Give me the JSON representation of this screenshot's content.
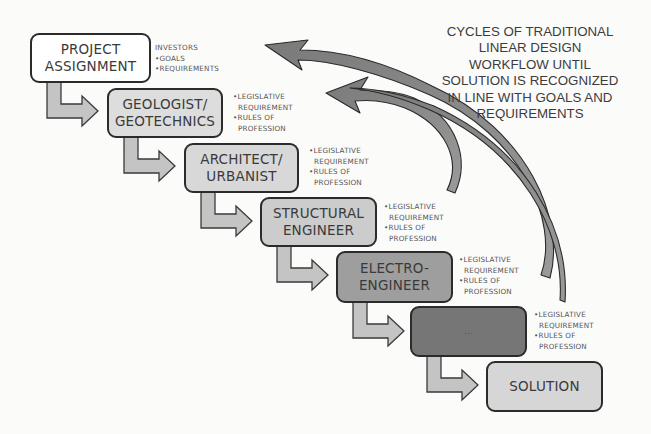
{
  "caption": {
    "lines": [
      "CYCLES OF TRADITIONAL",
      "LINEAR DESIGN",
      "WORKFLOW UNTIL",
      "SOLUTION IS RECOGNIZED",
      "IN LINE WITH GOALS AND",
      "REQUIREMENTS"
    ]
  },
  "colors": {
    "outline": "#2b2b2b",
    "box_white": "#ffffff",
    "box_light": "#dcdcdc",
    "box_mid": "#c9c9c9",
    "box_electro": "#9d9d9d",
    "box_dark": "#747474",
    "box_solution": "#d6d6d6",
    "step_arrow": "#c4c4c4",
    "cycle_arrow": "#8a8a8a"
  },
  "steps": [
    {
      "label": "PROJECT\nASSIGNMENT",
      "notes": [
        "INVESTORS",
        "•GOALS",
        "•REQUIREMENTS"
      ]
    },
    {
      "label": "GEOLOGIST/\nGEOTECHNICS",
      "notes": [
        "•LEGISLATIVE",
        "REQUIREMENT",
        "•RULES OF",
        "PROFESSION"
      ]
    },
    {
      "label": "ARCHITECT/\nURBANIST",
      "notes": [
        "•LEGISLATIVE",
        "REQUIREMENT",
        "•RULES OF",
        "PROFESSION"
      ]
    },
    {
      "label": "STRUCTURAL\nENGINEER",
      "notes": [
        "•LEGISLATIVE",
        "REQUIREMENT",
        "•RULES OF",
        "PROFESSION"
      ]
    },
    {
      "label": "ELECTRO-\nENGINEER",
      "notes": [
        "•LEGISLATIVE",
        "REQUIREMENT",
        "•RULES OF",
        "PROFESSION"
      ]
    },
    {
      "label": "...",
      "notes": [
        "•LEGISLATIVE",
        "REQUIREMENT",
        "•RULES OF",
        "PROFESSION"
      ]
    },
    {
      "label": "SOLUTION",
      "notes": []
    }
  ]
}
